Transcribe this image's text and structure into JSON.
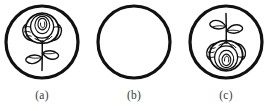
{
  "figure": {
    "type": "line-drawing-diagram",
    "background_color": "#ffffff",
    "ink_color": "#111111",
    "panels": [
      {
        "id": "a",
        "label": "(a)",
        "content": "rose-upright",
        "description": "Circular medallion containing a line drawing of a rose flower with layered spiral petals, sepals, a vertical stem and two leaves, oriented upright",
        "empty": false,
        "orientation": "upright",
        "circle_stroke_width": 3.2
      },
      {
        "id": "b",
        "label": "(b)",
        "content": "empty-circle",
        "description": "Empty circular medallion outline with no interior drawing",
        "empty": true,
        "orientation": "none",
        "circle_stroke_width": 3.2
      },
      {
        "id": "c",
        "label": "(c)",
        "content": "rose-inverted",
        "description": "Circular medallion containing the same rose line drawing as panel (a) but flipped vertically so the bloom hangs downward and the leaves sit at the top",
        "empty": false,
        "orientation": "inverted",
        "circle_stroke_width": 3.2
      }
    ]
  }
}
